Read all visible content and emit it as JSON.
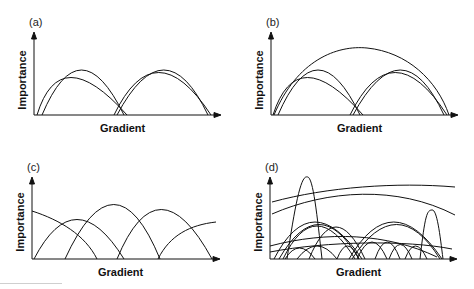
{
  "figure": {
    "panels": [
      {
        "id": "a",
        "label": "(a)",
        "ylabel": "Importance",
        "xlabel": "Gradient",
        "description": "Two clusters of overlapping humped curves, each cluster of two similar bell-shaped curves"
      },
      {
        "id": "b",
        "label": "(b)",
        "ylabel": "Importance",
        "xlabel": "Gradient",
        "description": "Same as (a) plus one broad curve spanning the whole gradient"
      },
      {
        "id": "c",
        "label": "(c)",
        "ylabel": "Importance",
        "xlabel": "Gradient",
        "description": "Evenly staggered curves along the gradient, truncated at the ends"
      },
      {
        "id": "d",
        "label": "(d)",
        "ylabel": "Importance",
        "xlabel": "Gradient",
        "description": "Many curves of varied width and height: narrow tall peaks, broad flat curves, and small humps"
      }
    ]
  },
  "colors": {
    "line": "#111111",
    "background": "#ffffff"
  }
}
